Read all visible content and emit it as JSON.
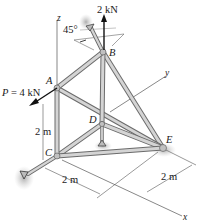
{
  "diagram": {
    "type": "3d-space-truss",
    "axes": {
      "z": "z",
      "y": "y",
      "x": "x"
    },
    "joints": {
      "A": "A",
      "B": "B",
      "C": "C",
      "D": "D",
      "E": "E"
    },
    "loads": {
      "vertical": "2 kN",
      "horizontal_at_A": "P = 4 kN"
    },
    "angle": "45°",
    "dimensions": {
      "height_AC": "2 m",
      "length_x": "2 m",
      "length_y": "2 m"
    },
    "colors": {
      "member_fill": "#cfcfcf",
      "member_edge": "#6b6b6b",
      "line": "#3a3a3a",
      "shadow": "#b8b8b8"
    }
  }
}
